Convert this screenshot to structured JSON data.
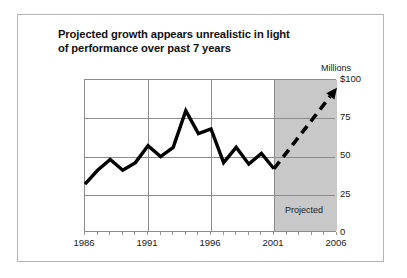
{
  "title": {
    "line1": "Projected growth appears unrealistic in light",
    "line2": "of performance over past 7 years"
  },
  "axis": {
    "units_label": "Millions",
    "y_ticks": [
      "$100",
      "75",
      "50",
      "25",
      "0"
    ],
    "x_ticks": [
      "1986",
      "1991",
      "1996",
      "2001",
      "2006"
    ]
  },
  "annotations": {
    "projected_label": "Projected"
  },
  "colors": {
    "line": "#000000",
    "shade": "#c8c8c8",
    "grid": "#8c8c8c",
    "frame": "#b4b4b4",
    "text": "#1a1a1a"
  },
  "chart_data": {
    "type": "line",
    "title": "Projected growth appears unrealistic in light of performance over past 7 years",
    "xlabel": "",
    "ylabel": "Millions",
    "xlim": [
      1986,
      2006
    ],
    "ylim": [
      0,
      100
    ],
    "yticks": [
      0,
      25,
      50,
      75,
      100
    ],
    "ytick_labels": [
      "0",
      "25",
      "50",
      "75",
      "$100"
    ],
    "xticks": [
      1986,
      1991,
      1996,
      2001,
      2006
    ],
    "grid": true,
    "legend": "none",
    "shaded_region": {
      "label": "Projected",
      "x_start": 2001,
      "x_end": 2006,
      "color": "#c8c8c8"
    },
    "series": [
      {
        "name": "Actual",
        "style": "solid",
        "x": [
          1986,
          1987,
          1988,
          1989,
          1990,
          1991,
          1992,
          1993,
          1994,
          1995,
          1996,
          1997,
          1998,
          1999,
          2000,
          2001
        ],
        "values": [
          32,
          41,
          48,
          41,
          46,
          57,
          50,
          56,
          80,
          65,
          68,
          46,
          56,
          45,
          52,
          42
        ]
      },
      {
        "name": "Projected",
        "style": "dashed",
        "arrow": true,
        "x": [
          2001,
          2006
        ],
        "values": [
          42,
          95
        ]
      }
    ]
  }
}
